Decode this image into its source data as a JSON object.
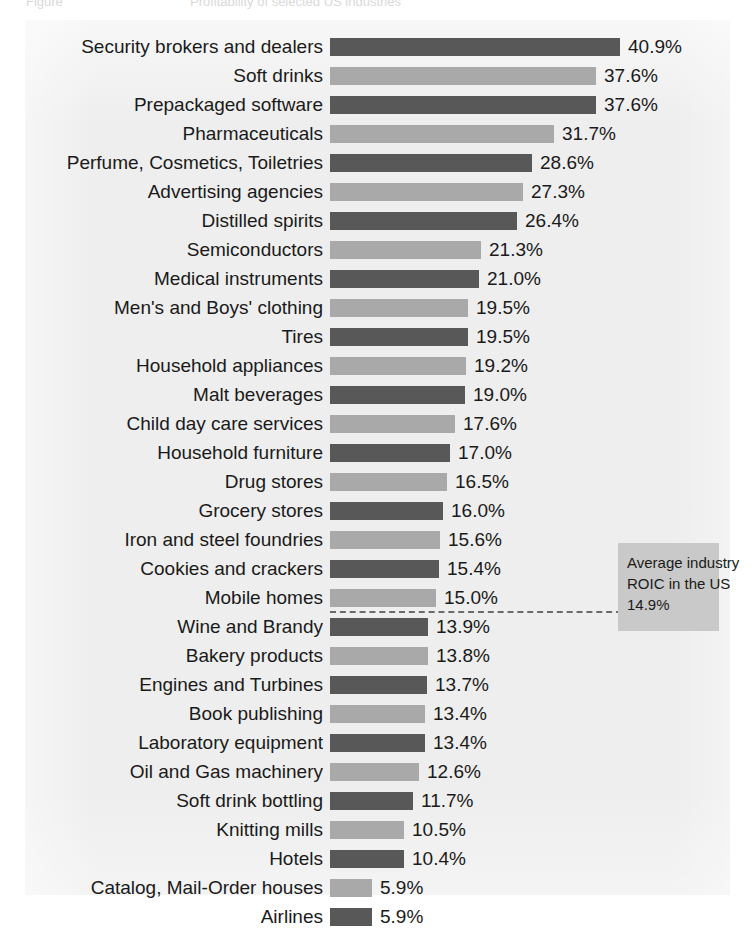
{
  "header": {
    "figure_label": "Figure",
    "title": "Profitability of selected US industries"
  },
  "annotation": {
    "line1": "Average industry",
    "line2": "ROIC in the US",
    "line3": "14.9%"
  },
  "colors": {
    "bar_dark": "#585858",
    "bar_light": "#a9a9a9",
    "panel_background": "#eeeeee",
    "annotation_background": "#c9c9c9",
    "text": "#1a1a1a"
  },
  "chart_data": {
    "type": "bar",
    "orientation": "horizontal",
    "title": "Profitability of selected US industries",
    "xlabel": "",
    "ylabel": "",
    "unit": "%",
    "value_suffix": "%",
    "xlim": [
      0,
      40.9
    ],
    "grid": false,
    "legend": null,
    "reference_line": {
      "label": "Average industry ROIC in the US",
      "value": 14.9,
      "value_label": "14.9%",
      "style": "dashed",
      "position_between": [
        "Mobile homes",
        "Wine and Brandy"
      ]
    },
    "categories": [
      "Security brokers and dealers",
      "Soft drinks",
      "Prepackaged software",
      "Pharmaceuticals",
      "Perfume, Cosmetics, Toiletries",
      "Advertising agencies",
      "Distilled spirits",
      "Semiconductors",
      "Medical instruments",
      "Men's and Boys' clothing",
      "Tires",
      "Household appliances",
      "Malt beverages",
      "Child day care services",
      "Household furniture",
      "Drug stores",
      "Grocery stores",
      "Iron and steel foundries",
      "Cookies and crackers",
      "Mobile homes",
      "Wine and Brandy",
      "Bakery products",
      "Engines and Turbines",
      "Book publishing",
      "Laboratory equipment",
      "Oil and Gas machinery",
      "Soft drink bottling",
      "Knitting mills",
      "Hotels",
      "Catalog, Mail-Order houses",
      "Airlines"
    ],
    "values": [
      40.9,
      37.6,
      37.6,
      31.7,
      28.6,
      27.3,
      26.4,
      21.3,
      21.0,
      19.5,
      19.5,
      19.2,
      19.0,
      17.6,
      17.0,
      16.5,
      16.0,
      15.6,
      15.4,
      15.0,
      13.9,
      13.8,
      13.7,
      13.4,
      13.4,
      12.6,
      11.7,
      10.5,
      10.4,
      5.9,
      5.9
    ],
    "value_labels": [
      "40.9%",
      "37.6%",
      "37.6%",
      "31.7%",
      "28.6%",
      "27.3%",
      "26.4%",
      "21.3%",
      "21.0%",
      "19.5%",
      "19.5%",
      "19.2%",
      "19.0%",
      "17.6%",
      "17.0%",
      "16.5%",
      "16.0%",
      "15.6%",
      "15.4%",
      "15.0%",
      "13.9%",
      "13.8%",
      "13.7%",
      "13.4%",
      "13.4%",
      "12.6%",
      "11.7%",
      "10.5%",
      "10.4%",
      "5.9%",
      "5.9%"
    ],
    "bar_shades": [
      "dark",
      "light",
      "dark",
      "light",
      "dark",
      "light",
      "dark",
      "light",
      "dark",
      "light",
      "dark",
      "light",
      "dark",
      "light",
      "dark",
      "light",
      "dark",
      "light",
      "dark",
      "light",
      "dark",
      "light",
      "dark",
      "light",
      "dark",
      "light",
      "dark",
      "light",
      "dark",
      "light",
      "dark"
    ]
  }
}
